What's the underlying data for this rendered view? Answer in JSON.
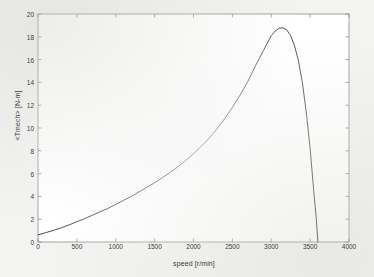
{
  "chart_data": {
    "type": "line",
    "title": "",
    "subtitle": "",
    "xlabel": "speed [r/min]",
    "ylabel": "<Tmech> [N-m]",
    "xlim": [
      0,
      4000
    ],
    "ylim": [
      0,
      20
    ],
    "xticks": [
      0,
      500,
      1000,
      1500,
      2000,
      2500,
      3000,
      3500,
      4000
    ],
    "yticks": [
      0,
      2,
      4,
      6,
      8,
      10,
      12,
      14,
      16,
      18,
      20
    ],
    "xtick_labels": [
      "0",
      "500",
      "1000",
      "1500",
      "2000",
      "2500",
      "3000",
      "3500",
      "4000"
    ],
    "ytick_labels": [
      "0",
      "2",
      "4",
      "6",
      "8",
      "10",
      "12",
      "14",
      "16",
      "18",
      "20"
    ],
    "grid": false,
    "legend": null,
    "legend_position": "none",
    "annotations": [],
    "line_color": "#2b2b2b",
    "series": [
      {
        "name": "<Tmech>",
        "x": [
          0,
          100,
          200,
          300,
          400,
          500,
          600,
          700,
          800,
          900,
          1000,
          1100,
          1200,
          1300,
          1400,
          1500,
          1600,
          1700,
          1800,
          1900,
          2000,
          2100,
          2200,
          2300,
          2400,
          2500,
          2600,
          2700,
          2800,
          2900,
          3000,
          3050,
          3100,
          3150,
          3200,
          3250,
          3300,
          3350,
          3400,
          3450,
          3500,
          3550,
          3580,
          3600
        ],
        "y": [
          0.62,
          0.82,
          1.02,
          1.25,
          1.5,
          1.78,
          2.05,
          2.35,
          2.65,
          2.95,
          3.3,
          3.65,
          4.0,
          4.4,
          4.8,
          5.2,
          5.65,
          6.1,
          6.6,
          7.15,
          7.75,
          8.4,
          9.1,
          9.9,
          10.8,
          11.8,
          12.9,
          14.1,
          15.5,
          16.8,
          18.1,
          18.5,
          18.75,
          18.8,
          18.6,
          18.1,
          17.2,
          15.9,
          14.0,
          11.4,
          8.2,
          4.2,
          2.0,
          0.0
        ]
      }
    ]
  },
  "figure": {
    "background_color": "#f3f3f1",
    "plot_area_color": "#ffffff",
    "axis_color": "#8a8a8a",
    "tick_label_color": "#3b3b3b"
  }
}
